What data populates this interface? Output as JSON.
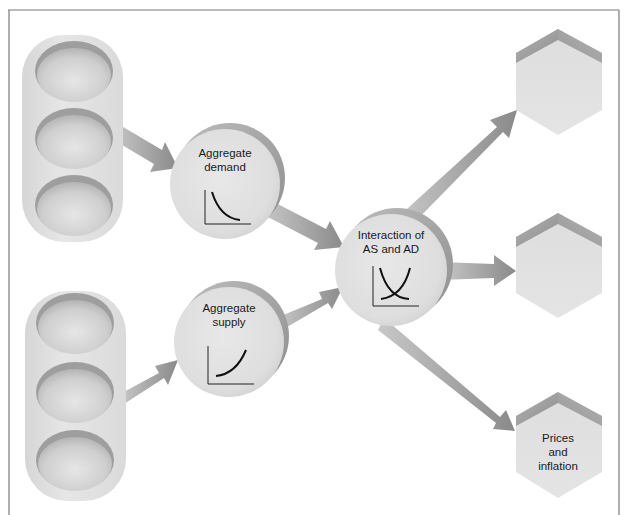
{
  "diagram": {
    "type": "flow",
    "colors": {
      "background": "#ffffff",
      "frame": "#7a7a7a",
      "shape_fill": "#e2e2e2",
      "shape_shadow": "#9a9a9a",
      "arrow": "#9c9c9c",
      "curve": "#111111"
    },
    "input_groups": [
      {
        "id": "inputs-demand",
        "slots": 3
      },
      {
        "id": "inputs-supply",
        "slots": 3
      }
    ],
    "nodes": {
      "aggregate_demand": {
        "label": "Aggregate\ndemand",
        "icon": "downward-sloping-curve-icon"
      },
      "aggregate_supply": {
        "label": "Aggregate\nsupply",
        "icon": "upward-sloping-curve-icon"
      },
      "interaction": {
        "label": "Interaction of\nAS and AD",
        "icon": "crossing-curves-icon"
      }
    },
    "outputs": [
      {
        "label": ""
      },
      {
        "label": ""
      },
      {
        "label": "Prices\nand\ninflation"
      }
    ],
    "edges": [
      {
        "from": "inputs-demand",
        "to": "aggregate_demand"
      },
      {
        "from": "inputs-supply",
        "to": "aggregate_supply"
      },
      {
        "from": "aggregate_demand",
        "to": "interaction"
      },
      {
        "from": "aggregate_supply",
        "to": "interaction"
      },
      {
        "from": "interaction",
        "to": "outputs.0"
      },
      {
        "from": "interaction",
        "to": "outputs.1"
      },
      {
        "from": "interaction",
        "to": "outputs.2"
      }
    ]
  }
}
